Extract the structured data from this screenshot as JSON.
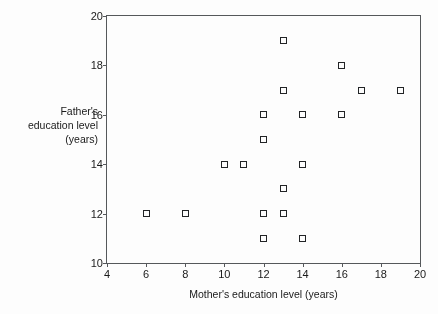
{
  "chart_data": {
    "type": "scatter",
    "title": "",
    "xlabel": "Mother's education level (years)",
    "ylabel": "Father's education level (years)",
    "ylabel_lines": [
      "Father's",
      "education level",
      "(years)"
    ],
    "xlim": [
      4,
      20
    ],
    "ylim": [
      10,
      20
    ],
    "xticks": [
      4,
      6,
      8,
      10,
      12,
      14,
      16,
      18,
      20
    ],
    "yticks": [
      10,
      12,
      14,
      16,
      18,
      20
    ],
    "xtick_labels": [
      "4",
      "6",
      "8",
      "10",
      "12",
      "14",
      "16",
      "18",
      "20"
    ],
    "ytick_labels": [
      "10",
      "12",
      "14",
      "16",
      "18",
      "20"
    ],
    "grid": false,
    "legend": null,
    "marker": "open-square",
    "marker_color": "#222426",
    "frame_color": "#55595c",
    "background": "#ffffff",
    "n_points": 19,
    "x": [
      6,
      8,
      10,
      11,
      12,
      12,
      12,
      12,
      13,
      13,
      13,
      13,
      14,
      14,
      14,
      16,
      16,
      17,
      19
    ],
    "y": [
      12,
      12,
      14,
      14,
      11,
      12,
      15,
      16,
      12,
      13,
      17,
      19,
      11,
      14,
      16,
      16,
      18,
      17,
      17
    ],
    "points": [
      {
        "x": 6,
        "y": 12
      },
      {
        "x": 8,
        "y": 12
      },
      {
        "x": 10,
        "y": 14
      },
      {
        "x": 11,
        "y": 14
      },
      {
        "x": 12,
        "y": 11
      },
      {
        "x": 12,
        "y": 12
      },
      {
        "x": 12,
        "y": 15
      },
      {
        "x": 12,
        "y": 16
      },
      {
        "x": 13,
        "y": 12
      },
      {
        "x": 13,
        "y": 13
      },
      {
        "x": 13,
        "y": 17
      },
      {
        "x": 13,
        "y": 19
      },
      {
        "x": 14,
        "y": 11
      },
      {
        "x": 14,
        "y": 14
      },
      {
        "x": 14,
        "y": 16
      },
      {
        "x": 16,
        "y": 16
      },
      {
        "x": 16,
        "y": 18
      },
      {
        "x": 17,
        "y": 17
      },
      {
        "x": 19,
        "y": 17
      }
    ]
  }
}
